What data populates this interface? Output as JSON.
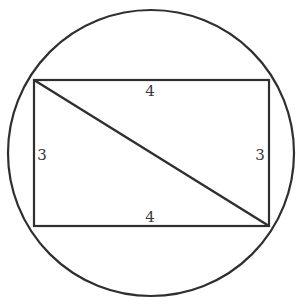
{
  "diagram": {
    "stroke_color": "#2f2f2f",
    "label_color": "#3a3a3a",
    "circle": {
      "cx": 151,
      "cy": 153,
      "r": 143
    },
    "rectangle": {
      "top_left": [
        34,
        80
      ],
      "top_right": [
        269,
        80
      ],
      "bottom_right": [
        269,
        226
      ],
      "bottom_left": [
        34,
        226
      ]
    },
    "diagonal": {
      "from": "top_left",
      "to": "bottom_right"
    },
    "labels": {
      "top": "4",
      "bottom": "4",
      "left": "3",
      "right": "3"
    }
  }
}
